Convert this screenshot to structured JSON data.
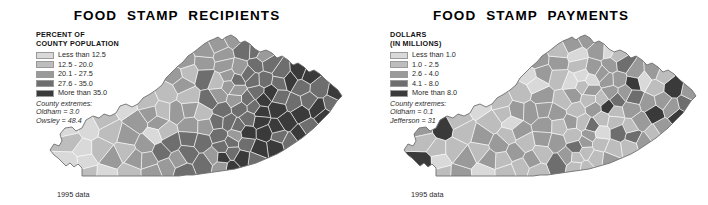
{
  "background": "#ffffff",
  "panels": [
    {
      "id": "recipients",
      "title": "FOOD  STAMP  RECIPIENTS",
      "legend": {
        "title_line1": "PERCENT OF",
        "title_line2": "COUNTY POPULATION",
        "items": [
          {
            "label": "Less than 12.5",
            "color": "#d9d9d9"
          },
          {
            "label": "12.5 - 20.0",
            "color": "#bdbdbd"
          },
          {
            "label": "20.1 - 27.5",
            "color": "#9a9a9a"
          },
          {
            "label": "27.6 - 35.0",
            "color": "#6e6e6e"
          },
          {
            "label": "More than 35.0",
            "color": "#3a3a3a"
          }
        ],
        "extremes_heading": "County extremes:",
        "extremes": [
          "Oldham = 3.0",
          "Owsley = 48.4"
        ]
      },
      "source": "1995 data"
    },
    {
      "id": "payments",
      "title": "FOOD  STAMP  PAYMENTS",
      "legend": {
        "title_line1": "DOLLARS",
        "title_line2": "(IN MILLIONS)",
        "items": [
          {
            "label": "Less than 1.0",
            "color": "#d9d9d9"
          },
          {
            "label": "1.0 - 2.5",
            "color": "#bdbdbd"
          },
          {
            "label": "2.6 - 4.0",
            "color": "#9a9a9a"
          },
          {
            "label": "4.1 - 8.0",
            "color": "#6e6e6e"
          },
          {
            "label": "More than 8.0",
            "color": "#3a3a3a"
          }
        ],
        "extremes_heading": "County extremes:",
        "extremes": [
          "Oldham = 0.1",
          "Jefferson = 31"
        ]
      },
      "source": "1995 data"
    }
  ],
  "chart_data": {
    "type": "heatmap",
    "subtype": "choropleth-map-pair",
    "region": "Kentucky counties",
    "legend_position": "upper-left",
    "grid": false,
    "maps": [
      {
        "name": "FOOD  STAMP  RECIPIENTS",
        "measure": "Percent of county population",
        "units": "percent",
        "bins": [
          {
            "label": "Less than 12.5",
            "min": 0,
            "max": 12.5,
            "color": "#d9d9d9"
          },
          {
            "label": "12.5 - 20.0",
            "min": 12.5,
            "max": 20.0,
            "color": "#bdbdbd"
          },
          {
            "label": "20.1 - 27.5",
            "min": 20.1,
            "max": 27.5,
            "color": "#9a9a9a"
          },
          {
            "label": "27.6 - 35.0",
            "min": 27.6,
            "max": 35.0,
            "color": "#6e6e6e"
          },
          {
            "label": "More than 35.0",
            "min": 35.0,
            "max": null,
            "color": "#3a3a3a"
          }
        ],
        "extremes": [
          {
            "county": "Oldham",
            "value": 3.0,
            "type": "minimum"
          },
          {
            "county": "Owsley",
            "value": 48.4,
            "type": "maximum"
          }
        ],
        "pattern": "Darkest classes concentrated in the eastern Appalachian counties; lightest classes in the north-central Bluegrass and Louisville suburbs.",
        "source": "1995 data"
      },
      {
        "name": "FOOD  STAMP  PAYMENTS",
        "measure": "Dollars",
        "units": "millions of dollars",
        "bins": [
          {
            "label": "Less than 1.0",
            "min": 0,
            "max": 1.0,
            "color": "#d9d9d9"
          },
          {
            "label": "1.0 - 2.5",
            "min": 1.0,
            "max": 2.5,
            "color": "#bdbdbd"
          },
          {
            "label": "2.6 - 4.0",
            "min": 2.6,
            "max": 4.0,
            "color": "#9a9a9a"
          },
          {
            "label": "4.1 - 8.0",
            "min": 4.1,
            "max": 8.0,
            "color": "#6e6e6e"
          },
          {
            "label": "More than 8.0",
            "min": 8.0,
            "max": null,
            "color": "#3a3a3a"
          }
        ],
        "extremes": [
          {
            "county": "Oldham",
            "value": 0.1,
            "type": "minimum"
          },
          {
            "county": "Jefferson",
            "value": 31,
            "type": "maximum"
          }
        ],
        "pattern": "Highest total payments in the largest-population counties (Jefferson, Fayette); most rural counties fall in the lowest classes.",
        "source": "1995 data"
      }
    ]
  }
}
